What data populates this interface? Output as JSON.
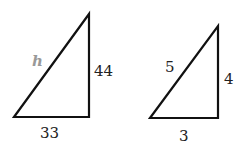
{
  "triangles": [
    {
      "hypotenuse_label": "h",
      "vertical_label": "44",
      "base_label": "33"
    },
    {
      "hypotenuse_label": "5",
      "vertical_label": "4",
      "base_label": "3"
    }
  ],
  "colors": {
    "stroke": "#111111",
    "unknown_label": "#999999"
  }
}
